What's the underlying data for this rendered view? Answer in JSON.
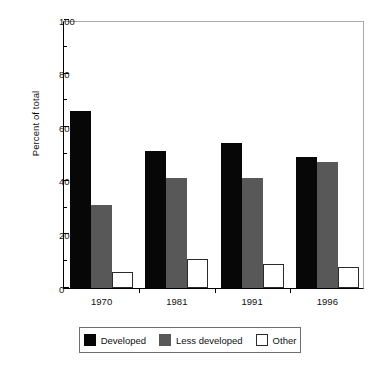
{
  "chart_data": {
    "type": "bar",
    "title": "",
    "xlabel": "",
    "ylabel": "Percent of total",
    "categories": [
      "1970",
      "1981",
      "1991",
      "1996"
    ],
    "series": [
      {
        "name": "Developed",
        "color": "#070707",
        "values": [
          66,
          51,
          54,
          49
        ]
      },
      {
        "name": "Less developed",
        "color": "#585858",
        "values": [
          31,
          41,
          41,
          47
        ]
      },
      {
        "name": "Other",
        "color": "#ffffff",
        "values": [
          6,
          11,
          9,
          8
        ]
      }
    ],
    "ylim": [
      0,
      100
    ],
    "ytick_labels": [
      "0",
      "20",
      "40",
      "60",
      "80",
      "100"
    ],
    "ytick_values": [
      0,
      20,
      40,
      60,
      80,
      100
    ],
    "yminor_values": [
      10,
      30,
      50,
      70,
      90
    ],
    "grid": false,
    "legend_position": "bottom"
  },
  "legend": {
    "items": [
      {
        "label": "Developed"
      },
      {
        "label": "Less developed"
      },
      {
        "label": "Other"
      }
    ]
  }
}
